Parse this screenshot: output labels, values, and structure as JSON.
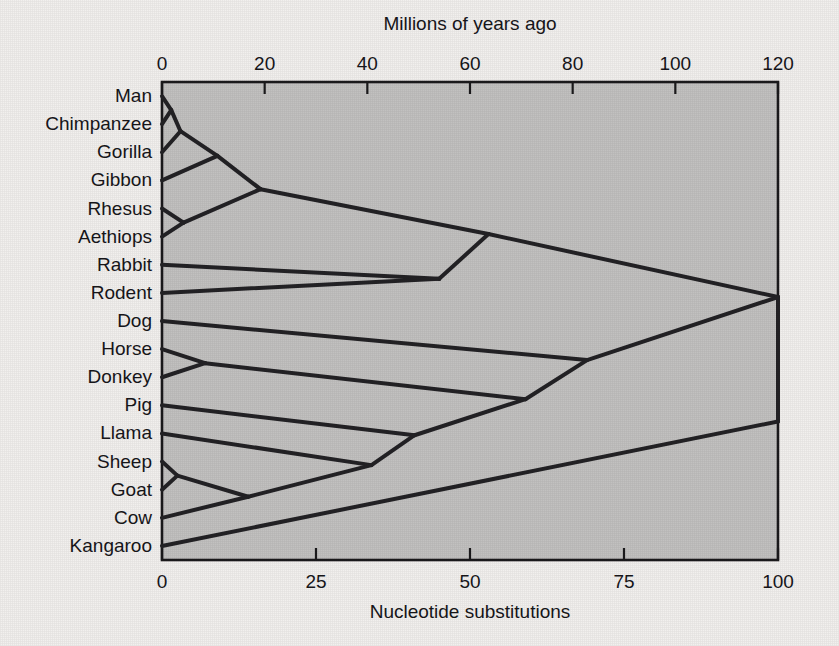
{
  "figure": {
    "title_top": "Millions of years ago",
    "title_bottom": "Nucleotide substitutions",
    "background_color": "#f2f0ee",
    "plot_fill_color": "#c2c1c0",
    "line_color": "#232225"
  },
  "chart_data": {
    "type": "line",
    "title": "Millions of years ago",
    "xlabel": "Nucleotide substitutions",
    "ylabel": "",
    "top_axis": {
      "label": "Millions of years ago",
      "ticks": [
        0,
        20,
        40,
        60,
        80,
        100,
        120
      ],
      "tick_labels": [
        "0",
        "20",
        "40",
        "60",
        "80",
        "100",
        "120"
      ],
      "range": [
        0,
        120
      ],
      "position": "top"
    },
    "bottom_axis": {
      "label": "Nucleotide substitutions",
      "ticks": [
        0,
        25,
        50,
        75,
        100
      ],
      "tick_labels": [
        "0",
        "25",
        "50",
        "75",
        "100"
      ],
      "range": [
        0,
        100
      ],
      "position": "bottom"
    },
    "grid": false,
    "legend": "none",
    "taxa": [
      {
        "name": "Man",
        "substitutions": 0
      },
      {
        "name": "Chimpanzee",
        "substitutions": 0
      },
      {
        "name": "Gorilla",
        "substitutions": 0
      },
      {
        "name": "Gibbon",
        "substitutions": 0
      },
      {
        "name": "Rhesus",
        "substitutions": 0
      },
      {
        "name": "Aethiops",
        "substitutions": 0
      },
      {
        "name": "Rabbit",
        "substitutions": 0
      },
      {
        "name": "Rodent",
        "substitutions": 0
      },
      {
        "name": "Dog",
        "substitutions": 0
      },
      {
        "name": "Horse",
        "substitutions": 0
      },
      {
        "name": "Donkey",
        "substitutions": 0
      },
      {
        "name": "Pig",
        "substitutions": 0
      },
      {
        "name": "Llama",
        "substitutions": 0
      },
      {
        "name": "Sheep",
        "substitutions": 0
      },
      {
        "name": "Goat",
        "substitutions": 0
      },
      {
        "name": "Cow",
        "substitutions": 0
      },
      {
        "name": "Kangaroo",
        "substitutions": 0
      }
    ],
    "internal_nodes": [
      {
        "id": "man_chimp",
        "substitutions": 1.5,
        "children": [
          "Man",
          "Chimpanzee"
        ]
      },
      {
        "id": "hominid",
        "substitutions": 3.0,
        "children": [
          "man_chimp",
          "Gorilla"
        ]
      },
      {
        "id": "hominoid",
        "substitutions": 9.0,
        "children": [
          "hominid",
          "Gibbon"
        ]
      },
      {
        "id": "cercopithecoid",
        "substitutions": 3.5,
        "children": [
          "Rhesus",
          "Aethiops"
        ]
      },
      {
        "id": "primates",
        "substitutions": 16.0,
        "children": [
          "hominoid",
          "cercopithecoid"
        ]
      },
      {
        "id": "glires",
        "substitutions": 45.0,
        "children": [
          "Rabbit",
          "Rodent"
        ]
      },
      {
        "id": "euarchontoglires",
        "substitutions": 53.0,
        "children": [
          "primates",
          "glires"
        ]
      },
      {
        "id": "horse_donkey",
        "substitutions": 7.0,
        "children": [
          "Horse",
          "Donkey"
        ]
      },
      {
        "id": "sheep_goat",
        "substitutions": 2.5,
        "children": [
          "Sheep",
          "Goat"
        ]
      },
      {
        "id": "bovids",
        "substitutions": 14.0,
        "children": [
          "sheep_goat",
          "Cow"
        ]
      },
      {
        "id": "ruminant_llama",
        "substitutions": 34.0,
        "children": [
          "bovids",
          "Llama"
        ]
      },
      {
        "id": "artiodactyl",
        "substitutions": 41.0,
        "children": [
          "ruminant_llama",
          "Pig"
        ]
      },
      {
        "id": "ungulates",
        "substitutions": 59.0,
        "children": [
          "artiodactyl",
          "horse_donkey"
        ]
      },
      {
        "id": "laurasiatheria",
        "substitutions": 69.0,
        "children": [
          "ungulates",
          "Dog"
        ]
      },
      {
        "id": "placentals",
        "substitutions": 100.0,
        "children": [
          "euarchontoglires",
          "laurasiatheria"
        ]
      },
      {
        "id": "root",
        "substitutions": 100.0,
        "children": [
          "placentals",
          "Kangaroo"
        ]
      }
    ]
  }
}
